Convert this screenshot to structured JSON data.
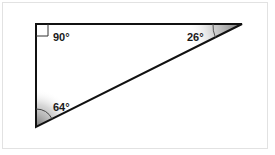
{
  "diagram": {
    "type": "right-triangle",
    "vertices": {
      "right_angle": {
        "x": 36,
        "y": 24
      },
      "acute_top": {
        "x": 242,
        "y": 24
      },
      "acute_bottom": {
        "x": 36,
        "y": 127
      }
    },
    "angles": [
      {
        "id": "right",
        "label": "90°",
        "value": 90
      },
      {
        "id": "top-right",
        "label": "26°",
        "value": 26
      },
      {
        "id": "bottom-left",
        "label": "64°",
        "value": 64
      }
    ],
    "colors": {
      "stroke": "#111111",
      "shade": "#8a8a8a",
      "frame": "#e2e2e2",
      "background": "#ffffff"
    }
  }
}
